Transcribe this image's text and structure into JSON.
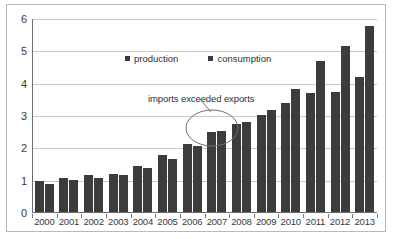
{
  "chart_data": {
    "type": "bar",
    "title": "",
    "xlabel": "",
    "ylabel": "",
    "ylim": [
      0,
      6
    ],
    "yticks": [
      0,
      1,
      2,
      3,
      4,
      5,
      6
    ],
    "grid": true,
    "legend_position": "top-center",
    "categories": [
      "2000",
      "2001",
      "2002",
      "2003",
      "2004",
      "2005",
      "2006",
      "2007",
      "2008",
      "2009",
      "2010",
      "2011",
      "2012",
      "2013"
    ],
    "series": [
      {
        "name": "production",
        "color": "#3c3c3c",
        "values": [
          0.95,
          1.06,
          1.13,
          1.18,
          1.43,
          1.75,
          2.09,
          2.46,
          2.72,
          3.0,
          3.36,
          3.68,
          3.72,
          4.18
        ]
      },
      {
        "name": "consumption",
        "color": "#3c3c3c",
        "values": [
          0.87,
          0.98,
          1.06,
          1.13,
          1.37,
          1.65,
          2.03,
          2.5,
          2.78,
          3.14,
          3.81,
          4.67,
          5.12,
          5.76
        ]
      }
    ],
    "annotations": [
      {
        "text": "imports exceeded exports",
        "points_to_category": "2007",
        "marker": "ellipse"
      }
    ]
  },
  "legend": {
    "items": [
      {
        "label": "production"
      },
      {
        "label": "consumption"
      }
    ]
  }
}
